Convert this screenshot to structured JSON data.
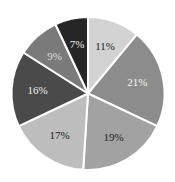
{
  "chart_data": {
    "type": "pie",
    "title": "",
    "start_angle_deg": 0,
    "direction": "clockwise",
    "categories": [
      "A",
      "B",
      "C",
      "D",
      "E",
      "F",
      "G"
    ],
    "values": [
      11,
      21,
      19,
      17,
      16,
      9,
      7
    ],
    "labels": [
      "11%",
      "21%",
      "19%",
      "17%",
      "16%",
      "9%",
      "7%"
    ],
    "colors": [
      "#d2d2d2",
      "#8c8c8c",
      "#a2a2a2",
      "#bdbdbd",
      "#4a4a4a",
      "#7a7a7a",
      "#262626"
    ],
    "label_colors": [
      "#222222",
      "#f2f2f2",
      "#222222",
      "#222222",
      "#eeeeee",
      "#dddddd",
      "#eeeeee"
    ],
    "legend": false,
    "center": [
      88,
      93.5
    ],
    "radius": 76.5
  }
}
